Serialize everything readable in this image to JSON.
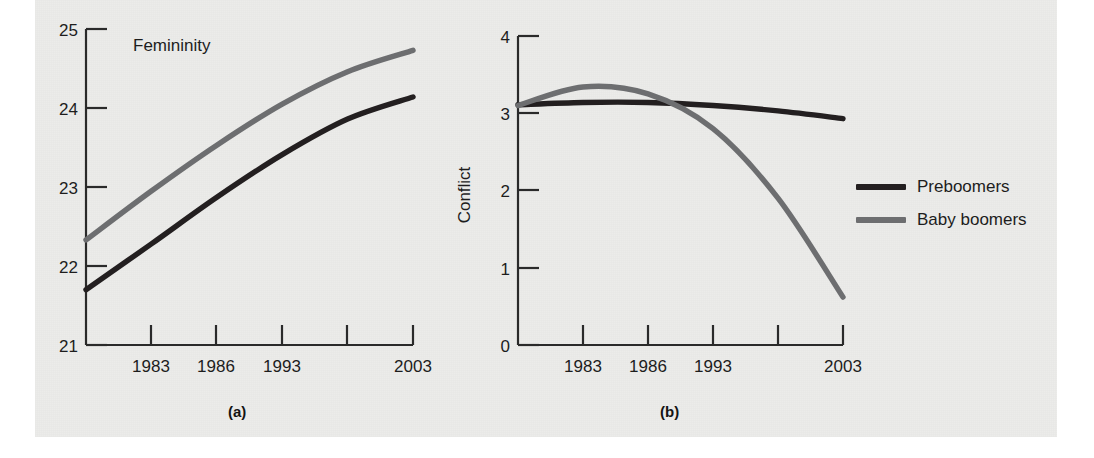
{
  "figure": {
    "panel_a_caption": "(a)",
    "panel_b_caption": "(b)"
  },
  "legend": {
    "position": "right",
    "items": [
      {
        "label": "Preboomers",
        "color": "#231f20"
      },
      {
        "label": "Baby boomers",
        "color": "#6d6e70"
      }
    ]
  },
  "colors": {
    "preboomers": "#231f20",
    "baby_boomers": "#6d6e70",
    "axis": "#2a2a2a",
    "page_background": "#ececea",
    "text": "#1d1d1d"
  },
  "chart_data": [
    {
      "type": "line",
      "panel": "(a)",
      "title": "Femininity",
      "xlabel": "",
      "ylabel": "",
      "grid": false,
      "legend": "none",
      "categories": [
        "1983",
        "1986",
        "1993",
        "2003"
      ],
      "x_tick_labels": [
        "",
        "1983",
        "1986",
        "1993",
        "",
        "2003"
      ],
      "x_tick_positions": [
        0,
        1,
        2,
        3,
        4,
        5
      ],
      "y_tick_labels": [
        "21",
        "22",
        "23",
        "24",
        "25"
      ],
      "ylim": [
        21,
        25
      ],
      "xlim": [
        0,
        5
      ],
      "series": [
        {
          "name": "Baby boomers",
          "color": "#6d6e70",
          "x": [
            0,
            1,
            2,
            3,
            4,
            5
          ],
          "values": [
            22.33,
            22.95,
            23.53,
            24.05,
            24.46,
            24.73
          ]
        },
        {
          "name": "Preboomers",
          "color": "#231f20",
          "x": [
            0,
            1,
            2,
            3,
            4,
            5
          ],
          "values": [
            21.7,
            22.28,
            22.87,
            23.41,
            23.86,
            24.14
          ]
        }
      ]
    },
    {
      "type": "line",
      "panel": "(b)",
      "title": "",
      "xlabel": "",
      "ylabel": "Conflict",
      "grid": false,
      "legend": "right",
      "categories": [
        "1983",
        "1986",
        "1993",
        "2003"
      ],
      "x_tick_labels": [
        "",
        "1983",
        "1986",
        "1993",
        "",
        "2003"
      ],
      "x_tick_positions": [
        0,
        1,
        2,
        3,
        4,
        5
      ],
      "y_tick_labels": [
        "0",
        "1",
        "2",
        "3",
        "4"
      ],
      "ylim": [
        0,
        4
      ],
      "xlim": [
        0,
        5
      ],
      "annotations": [
        "Baby boomers peak near 3.34 around 1983",
        "Curves cross just after 1986",
        "Baby boomers drop to about 0.62 by 2003"
      ],
      "series": [
        {
          "name": "Preboomers",
          "color": "#231f20",
          "x": [
            0,
            1,
            2,
            3,
            4,
            5
          ],
          "values": [
            3.11,
            3.14,
            3.14,
            3.1,
            3.03,
            2.93
          ]
        },
        {
          "name": "Baby boomers",
          "color": "#6d6e70",
          "x": [
            0,
            1,
            2,
            3,
            4,
            5
          ],
          "values": [
            3.1,
            3.34,
            3.25,
            2.8,
            1.9,
            0.62
          ]
        }
      ]
    }
  ]
}
